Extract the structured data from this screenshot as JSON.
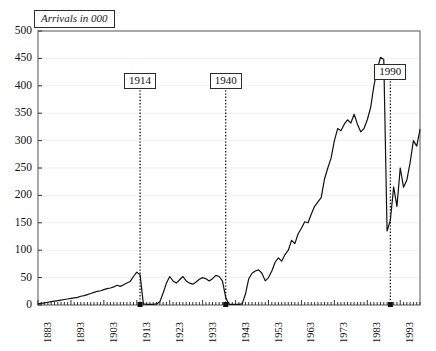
{
  "chart_data": {
    "type": "line",
    "title": "Arrivals in 000",
    "xlabel": "",
    "ylabel": "",
    "xlim": [
      1883,
      1999
    ],
    "ylim": [
      0,
      500
    ],
    "ytick_step": 50,
    "yticks": [
      0,
      50,
      100,
      150,
      200,
      250,
      300,
      350,
      400,
      450,
      500
    ],
    "xticks": [
      1883,
      1893,
      1903,
      1913,
      1923,
      1933,
      1943,
      1953,
      1963,
      1973,
      1983,
      1993
    ],
    "xtick_minor_step": 1,
    "grid": "horizontal-faint",
    "legend": "none",
    "line_color": "#111111",
    "annotations": [
      {
        "label": "1914",
        "x": 1914,
        "style": "dotted-vertical-line-with-boxed-label"
      },
      {
        "label": "1940",
        "x": 1940,
        "style": "dotted-vertical-line-with-boxed-label"
      },
      {
        "label": "1990",
        "x": 1990,
        "style": "dotted-vertical-line-with-boxed-label"
      }
    ],
    "x": [
      1883,
      1884,
      1885,
      1886,
      1887,
      1888,
      1889,
      1890,
      1891,
      1892,
      1893,
      1894,
      1895,
      1896,
      1897,
      1898,
      1899,
      1900,
      1901,
      1902,
      1903,
      1904,
      1905,
      1906,
      1907,
      1908,
      1909,
      1910,
      1911,
      1912,
      1913,
      1914,
      1915,
      1916,
      1917,
      1918,
      1919,
      1920,
      1921,
      1922,
      1923,
      1924,
      1925,
      1926,
      1927,
      1928,
      1929,
      1930,
      1931,
      1932,
      1933,
      1934,
      1935,
      1936,
      1937,
      1938,
      1939,
      1940,
      1941,
      1942,
      1943,
      1944,
      1945,
      1946,
      1947,
      1948,
      1949,
      1950,
      1951,
      1952,
      1953,
      1954,
      1955,
      1956,
      1957,
      1958,
      1959,
      1960,
      1961,
      1962,
      1963,
      1964,
      1965,
      1966,
      1967,
      1968,
      1969,
      1970,
      1971,
      1972,
      1973,
      1974,
      1975,
      1976,
      1977,
      1978,
      1979,
      1980,
      1981,
      1982,
      1983,
      1984,
      1985,
      1986,
      1987,
      1988,
      1989,
      1990,
      1991,
      1992,
      1993,
      1994,
      1995,
      1996,
      1997,
      1998,
      1999
    ],
    "values": [
      2,
      3,
      4,
      5,
      6,
      7,
      8,
      9,
      10,
      11,
      12,
      13,
      14,
      16,
      17,
      19,
      21,
      23,
      25,
      26,
      28,
      30,
      31,
      33,
      36,
      34,
      37,
      40,
      43,
      52,
      60,
      55,
      2,
      1,
      1,
      1,
      2,
      6,
      22,
      40,
      52,
      44,
      40,
      46,
      52,
      44,
      40,
      38,
      42,
      47,
      50,
      48,
      44,
      48,
      54,
      52,
      44,
      14,
      1,
      1,
      1,
      1,
      2,
      20,
      48,
      58,
      62,
      64,
      58,
      44,
      50,
      62,
      78,
      86,
      80,
      92,
      100,
      118,
      112,
      130,
      140,
      152,
      150,
      166,
      180,
      188,
      196,
      230,
      250,
      268,
      300,
      322,
      318,
      330,
      338,
      332,
      348,
      330,
      316,
      322,
      338,
      360,
      400,
      430,
      452,
      448,
      135,
      155,
      215,
      180,
      250,
      215,
      228,
      260,
      300,
      290,
      320
    ]
  }
}
